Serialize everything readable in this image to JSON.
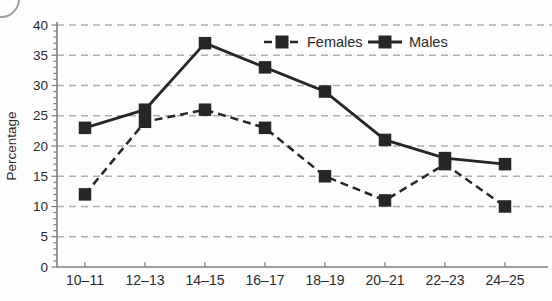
{
  "figure": {
    "ylabel": "Percentage"
  },
  "chart_data": {
    "type": "line",
    "title": "",
    "xlabel": "",
    "ylabel": "Percentage",
    "categories": [
      "10–11",
      "12–13",
      "14–15",
      "16–17",
      "18–19",
      "20–21",
      "22–23",
      "24–25"
    ],
    "series": [
      {
        "name": "Females",
        "style": "dashed",
        "marker": "filled-square",
        "values": [
          12,
          24,
          26,
          23,
          15,
          11,
          17,
          10
        ]
      },
      {
        "name": "Males",
        "style": "solid",
        "marker": "filled-square",
        "values": [
          23,
          26,
          37,
          33,
          29,
          21,
          18,
          17
        ]
      }
    ],
    "ylim": [
      0,
      40
    ],
    "ytick_step": 5,
    "y_minor_tick_step": 1,
    "grid": "horizontal-dashed",
    "legend_position": "top-center-inside",
    "line_color": "#262626",
    "grid_color": "#b0b0b0",
    "axis_color": "#7d7d7d"
  }
}
